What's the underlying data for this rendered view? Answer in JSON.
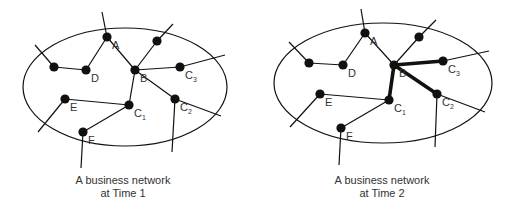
{
  "colors": {
    "ink": "#111111",
    "label": "#333333",
    "background": "#ffffff"
  },
  "diagrams": [
    {
      "id": "time1",
      "caption_line1": "A business network",
      "caption_line2": "at Time 1",
      "ellipse": {
        "cx": 125,
        "cy": 87,
        "rx": 102,
        "ry": 59
      },
      "nodes": [
        {
          "id": "A",
          "label": "A",
          "sub": "",
          "x": 107,
          "y": 37
        },
        {
          "id": "top",
          "label": "",
          "sub": "",
          "x": 157,
          "y": 41
        },
        {
          "id": "left",
          "label": "",
          "sub": "",
          "x": 54,
          "y": 67
        },
        {
          "id": "D",
          "label": "D",
          "sub": "",
          "x": 86,
          "y": 70
        },
        {
          "id": "B",
          "label": "B",
          "sub": "",
          "x": 135,
          "y": 70
        },
        {
          "id": "C3",
          "label": "C",
          "sub": "3",
          "x": 180,
          "y": 67
        },
        {
          "id": "E",
          "label": "E",
          "sub": "",
          "x": 65,
          "y": 99
        },
        {
          "id": "C1",
          "label": "C",
          "sub": "1",
          "x": 129,
          "y": 105
        },
        {
          "id": "C2",
          "label": "C",
          "sub": "2",
          "x": 175,
          "y": 99
        },
        {
          "id": "F",
          "label": "F",
          "sub": "",
          "x": 83,
          "y": 132
        }
      ],
      "edges": [
        {
          "from": "A",
          "to": "D",
          "bold": false
        },
        {
          "from": "A",
          "to": "B",
          "bold": false
        },
        {
          "from": "left",
          "to": "D",
          "bold": false
        },
        {
          "from": "B",
          "to": "top",
          "bold": false
        },
        {
          "from": "B",
          "to": "C3",
          "bold": false
        },
        {
          "from": "B",
          "to": "C1",
          "bold": false
        },
        {
          "from": "B",
          "to": "C2",
          "bold": false
        },
        {
          "from": "E",
          "to": "C1",
          "bold": false
        },
        {
          "from": "C1",
          "to": "F",
          "bold": false
        }
      ],
      "external_links": [
        {
          "from": "A",
          "x": 102,
          "y": 12
        },
        {
          "from": "top",
          "x": 173,
          "y": 24
        },
        {
          "from": "left",
          "x": 35,
          "y": 45
        },
        {
          "from": "C3",
          "x": 225,
          "y": 55
        },
        {
          "from": "C2",
          "x": 221,
          "y": 116
        },
        {
          "from": "C2",
          "x": 172,
          "y": 152
        },
        {
          "from": "E",
          "x": 38,
          "y": 132
        },
        {
          "from": "F",
          "x": 81,
          "y": 168
        }
      ]
    },
    {
      "id": "time2",
      "caption_line1": "A business network",
      "caption_line2": "at Time 2",
      "ellipse": {
        "cx": 383,
        "cy": 83,
        "rx": 109,
        "ry": 60
      },
      "nodes": [
        {
          "id": "A",
          "label": "A",
          "sub": "",
          "x": 365,
          "y": 33
        },
        {
          "id": "top",
          "label": "",
          "sub": "",
          "x": 419,
          "y": 37
        },
        {
          "id": "left",
          "label": "",
          "sub": "",
          "x": 309,
          "y": 63
        },
        {
          "id": "D",
          "label": "D",
          "sub": "",
          "x": 343,
          "y": 65
        },
        {
          "id": "B",
          "label": "B",
          "sub": "",
          "x": 394,
          "y": 65
        },
        {
          "id": "C3",
          "label": "C",
          "sub": "3",
          "x": 443,
          "y": 61
        },
        {
          "id": "E",
          "label": "E",
          "sub": "",
          "x": 320,
          "y": 94
        },
        {
          "id": "C1",
          "label": "C",
          "sub": "1",
          "x": 389,
          "y": 100
        },
        {
          "id": "C2",
          "label": "C",
          "sub": "2",
          "x": 437,
          "y": 94
        },
        {
          "id": "F",
          "label": "F",
          "sub": "",
          "x": 341,
          "y": 128
        }
      ],
      "edges": [
        {
          "from": "A",
          "to": "D",
          "bold": false
        },
        {
          "from": "A",
          "to": "B",
          "bold": false
        },
        {
          "from": "left",
          "to": "D",
          "bold": false
        },
        {
          "from": "B",
          "to": "top",
          "bold": false
        },
        {
          "from": "B",
          "to": "C3",
          "bold": true
        },
        {
          "from": "B",
          "to": "C1",
          "bold": true
        },
        {
          "from": "B",
          "to": "C2",
          "bold": true
        },
        {
          "from": "E",
          "to": "C1",
          "bold": false
        },
        {
          "from": "C1",
          "to": "F",
          "bold": false
        }
      ],
      "external_links": [
        {
          "from": "A",
          "x": 361,
          "y": 9
        },
        {
          "from": "top",
          "x": 436,
          "y": 20
        },
        {
          "from": "left",
          "x": 289,
          "y": 42
        },
        {
          "from": "C3",
          "x": 489,
          "y": 51
        },
        {
          "from": "C2",
          "x": 485,
          "y": 112
        },
        {
          "from": "C2",
          "x": 435,
          "y": 147
        },
        {
          "from": "E",
          "x": 290,
          "y": 127
        },
        {
          "from": "F",
          "x": 339,
          "y": 165
        }
      ]
    }
  ]
}
